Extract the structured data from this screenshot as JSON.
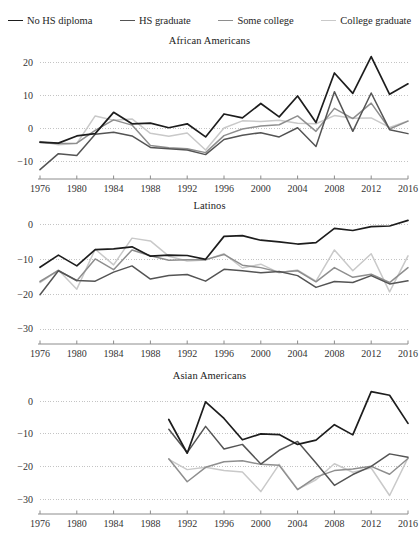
{
  "legend": {
    "items": [
      {
        "label": "No HS diploma",
        "color": "#1d1d1d"
      },
      {
        "label": "HS graduate",
        "color": "#545454"
      },
      {
        "label": "Some college",
        "color": "#8e8e8e"
      },
      {
        "label": "College graduate",
        "color": "#c9c9c9"
      }
    ]
  },
  "chart_data": [
    {
      "type": "line",
      "title": "African Americans",
      "xlabel": "",
      "ylabel": "",
      "grid": true,
      "legend_position": "top",
      "x": [
        1976,
        1978,
        1980,
        1982,
        1984,
        1986,
        1988,
        1990,
        1992,
        1994,
        1996,
        1998,
        2000,
        2002,
        2004,
        2006,
        2008,
        2010,
        2012,
        2014,
        2016
      ],
      "xlim": [
        1976,
        2016
      ],
      "xticks": [
        1976,
        1980,
        1984,
        1988,
        1992,
        1996,
        2000,
        2004,
        2008,
        2012,
        2016
      ],
      "ylim": [
        -13,
        23
      ],
      "yticks": [
        20,
        10,
        0,
        -10
      ],
      "ytick_labels": [
        "20",
        "10",
        "0",
        "−10"
      ],
      "series": [
        {
          "name": "No HS diploma",
          "color": "#1d1d1d",
          "values": [
            -4.2,
            -4.5,
            -2.3,
            -1.6,
            4.9,
            1.4,
            1.6,
            0.2,
            1.4,
            -2.6,
            4.4,
            3.2,
            7.6,
            3.5,
            9.9,
            1.8,
            16.9,
            10.7,
            21.9,
            10.4,
            13.6
          ]
        },
        {
          "name": "HS graduate",
          "color": "#545454",
          "values": [
            -12.6,
            -7.7,
            -8.3,
            -1.8,
            -1.2,
            -2.3,
            -5.8,
            -6.2,
            -6.6,
            -8.0,
            -3.4,
            -2.1,
            -1.3,
            -2.6,
            0.2,
            -5.5,
            11.2,
            -0.9,
            10.8,
            -0.4,
            -1.6
          ]
        },
        {
          "name": "Some college",
          "color": "#8e8e8e",
          "values": [
            -4.3,
            -4.6,
            -4.5,
            -0.6,
            2.6,
            1.0,
            -5.2,
            -5.9,
            -6.2,
            -7.4,
            -2.2,
            -0.2,
            0.7,
            1.1,
            3.8,
            -0.9,
            6.1,
            3.0,
            7.7,
            -0.2,
            2.2
          ]
        },
        {
          "name": "College graduate",
          "color": "#c9c9c9",
          "values": [
            -4.0,
            -5.0,
            -4.6,
            3.8,
            2.5,
            2.9,
            -1.5,
            -2.4,
            -1.4,
            -6.6,
            0.1,
            2.3,
            2.1,
            2.5,
            1.6,
            1.4,
            3.9,
            3.1,
            3.2,
            0.3,
            2.3
          ]
        }
      ]
    },
    {
      "type": "line",
      "title": "Latinos",
      "xlabel": "",
      "ylabel": "",
      "grid": true,
      "legend_position": "top",
      "x": [
        1976,
        1978,
        1980,
        1982,
        1984,
        1986,
        1988,
        1990,
        1992,
        1994,
        1996,
        1998,
        2000,
        2002,
        2004,
        2006,
        2008,
        2010,
        2012,
        2014,
        2016
      ],
      "xlim": [
        1976,
        2016
      ],
      "xticks": [
        1976,
        1980,
        1984,
        1988,
        1992,
        1996,
        2000,
        2004,
        2008,
        2012,
        2016
      ],
      "ylim": [
        -32,
        2
      ],
      "yticks": [
        0,
        -10,
        -20,
        -30
      ],
      "ytick_labels": [
        "0",
        "−10",
        "−20",
        "−30"
      ],
      "series": [
        {
          "name": "No HS diploma",
          "color": "#1d1d1d",
          "values": [
            -12.2,
            -8.7,
            -11.8,
            -7.1,
            -6.9,
            -6.3,
            -9.0,
            -8.7,
            -8.8,
            -9.9,
            -3.3,
            -3.1,
            -4.4,
            -4.9,
            -5.5,
            -5.1,
            -1.0,
            -1.6,
            -0.5,
            -0.3,
            1.3
          ]
        },
        {
          "name": "HS graduate",
          "color": "#545454",
          "values": [
            -20.1,
            -13.2,
            -16.0,
            -16.2,
            -13.6,
            -11.8,
            -15.6,
            -14.6,
            -14.3,
            -16.2,
            -12.8,
            -13.2,
            -13.8,
            -13.4,
            -14.6,
            -18.0,
            -16.3,
            -16.6,
            -14.6,
            -17.0,
            -16.1
          ]
        },
        {
          "name": "Some college",
          "color": "#8e8e8e",
          "values": [
            -16.3,
            -13.1,
            -16.1,
            -9.8,
            -12.9,
            -7.2,
            -8.9,
            -10.2,
            -10.0,
            -10.0,
            -8.5,
            -11.6,
            -12.3,
            -13.6,
            -13.2,
            -16.4,
            -12.3,
            -15.1,
            -14.2,
            -16.6,
            -12.3
          ]
        },
        {
          "name": "College graduate",
          "color": "#c9c9c9",
          "values": [
            -16.6,
            -13.0,
            -18.5,
            -7.0,
            -11.5,
            -3.8,
            -4.6,
            -9.0,
            -10.4,
            -10.1,
            -8.3,
            -12.4,
            -11.3,
            -13.8,
            -13.0,
            -16.2,
            -7.2,
            -13.2,
            -8.3,
            -19.3,
            -8.9
          ]
        }
      ]
    },
    {
      "type": "line",
      "title": "Asian Americans",
      "xlabel": "",
      "ylabel": "",
      "grid": true,
      "legend_position": "top",
      "x": [
        1990,
        1992,
        1994,
        1996,
        1998,
        2000,
        2002,
        2004,
        2006,
        2008,
        2010,
        2012,
        2014,
        2016
      ],
      "xlim": [
        1976,
        2016
      ],
      "xticks": [
        1976,
        1980,
        1984,
        1988,
        1992,
        1996,
        2000,
        2004,
        2008,
        2012,
        2016
      ],
      "ylim": [
        -32,
        4
      ],
      "yticks": [
        0,
        -10,
        -20,
        -30
      ],
      "ytick_labels": [
        "0",
        "−10",
        "−20",
        "−30"
      ],
      "series": [
        {
          "name": "No HS diploma",
          "color": "#1d1d1d",
          "values": [
            -5.6,
            -15.9,
            -0.2,
            -5.3,
            -11.8,
            -10.0,
            -10.2,
            -13.2,
            -11.9,
            -7.2,
            -10.3,
            2.9,
            1.8,
            -6.8
          ]
        },
        {
          "name": "HS graduate",
          "color": "#545454",
          "values": [
            -8.6,
            -15.7,
            -7.7,
            -14.6,
            -13.2,
            -19.2,
            -15.0,
            -12.3,
            -18.9,
            -25.7,
            -22.4,
            -19.9,
            -16.1,
            -17.1
          ]
        },
        {
          "name": "Some college",
          "color": "#8e8e8e",
          "values": [
            -17.6,
            -24.6,
            -20.2,
            -18.5,
            -18.2,
            -19.3,
            -19.6,
            -27.0,
            -23.2,
            -21.2,
            -20.7,
            -19.9,
            -22.3,
            -17.5
          ]
        },
        {
          "name": "College graduate",
          "color": "#c9c9c9",
          "values": [
            -17.8,
            -20.9,
            -20.2,
            -21.2,
            -21.6,
            -27.6,
            -19.3,
            -26.9,
            -24.0,
            -19.1,
            -21.7,
            -20.4,
            -28.8,
            -17.3
          ]
        }
      ]
    }
  ]
}
